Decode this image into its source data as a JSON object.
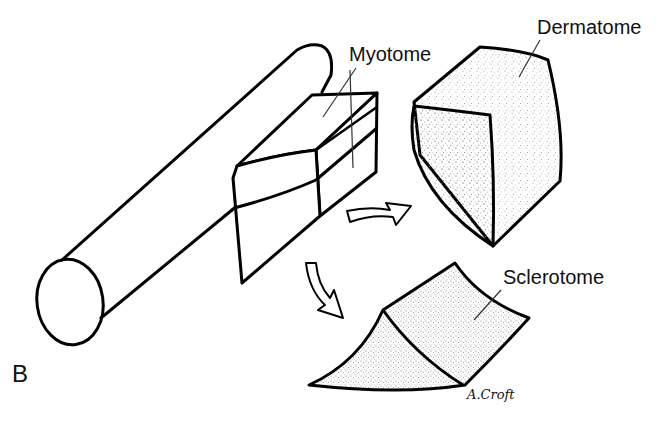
{
  "figure": {
    "panel_label": "B",
    "labels": {
      "myotome": "Myotome",
      "dermatome": "Dermatome",
      "sclerotome": "Sclerotome"
    },
    "signature": "A.Croft",
    "colors": {
      "line": "#000000",
      "background": "#ffffff",
      "stipple": "#9a9a9a"
    },
    "structures": [
      "neural-tube-cylinder",
      "somite-block",
      "dermatome-piece",
      "sclerotome-piece"
    ],
    "arrows": [
      {
        "from": "somite-block",
        "to": "dermatome-piece"
      },
      {
        "from": "somite-block",
        "to": "sclerotome-piece"
      }
    ]
  }
}
